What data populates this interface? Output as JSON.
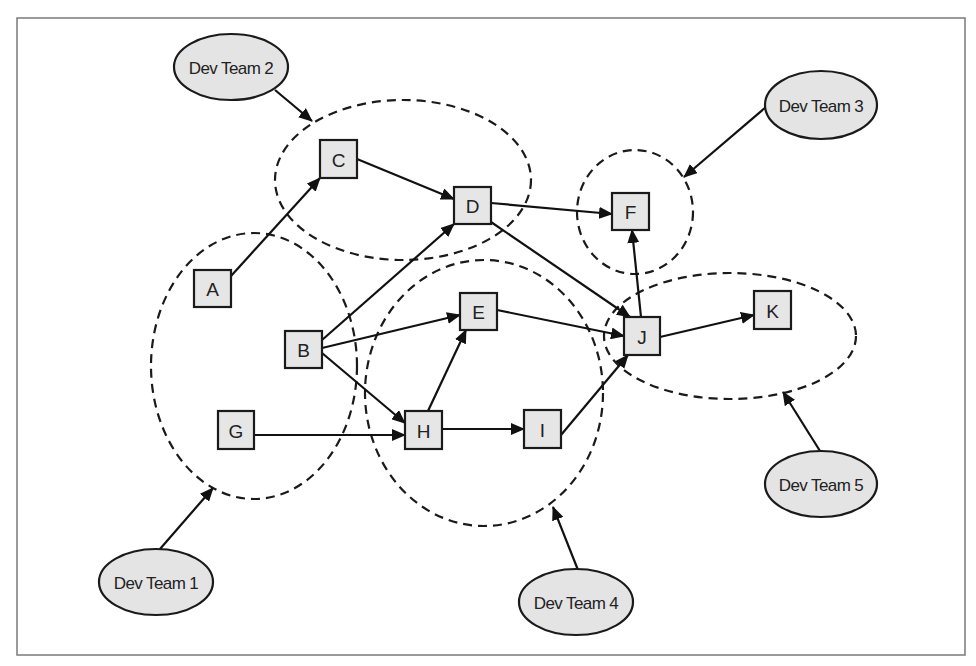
{
  "diagram": {
    "type": "dependency-graph",
    "frame": {
      "x": 17,
      "y": 18,
      "width": 948,
      "height": 637
    },
    "colors": {
      "node_fill": "#e6e6e6",
      "team_fill": "#e4e4e4",
      "stroke": "#1a1a1a",
      "frame_stroke": "#7a7a7a"
    },
    "nodes": [
      {
        "id": "A",
        "label": "A",
        "x": 194,
        "y": 270,
        "w": 37,
        "h": 37
      },
      {
        "id": "B",
        "label": "B",
        "x": 285,
        "y": 331,
        "w": 37,
        "h": 37
      },
      {
        "id": "C",
        "label": "C",
        "x": 320,
        "y": 140,
        "w": 37,
        "h": 38
      },
      {
        "id": "D",
        "label": "D",
        "x": 454,
        "y": 187,
        "w": 37,
        "h": 37
      },
      {
        "id": "E",
        "label": "E",
        "x": 460,
        "y": 293,
        "w": 37,
        "h": 37
      },
      {
        "id": "F",
        "label": "F",
        "x": 612,
        "y": 193,
        "w": 37,
        "h": 37
      },
      {
        "id": "G",
        "label": "G",
        "x": 218,
        "y": 411,
        "w": 36,
        "h": 38
      },
      {
        "id": "H",
        "label": "H",
        "x": 405,
        "y": 411,
        "w": 37,
        "h": 38
      },
      {
        "id": "I",
        "label": "I",
        "x": 524,
        "y": 410,
        "w": 37,
        "h": 38
      },
      {
        "id": "J",
        "label": "J",
        "x": 624,
        "y": 317,
        "w": 36,
        "h": 38
      },
      {
        "id": "K",
        "label": "K",
        "x": 754,
        "y": 291,
        "w": 37,
        "h": 38
      }
    ],
    "edges": [
      {
        "from": "A",
        "to": "C",
        "x1": 231,
        "y1": 276,
        "x2": 320,
        "y2": 178
      },
      {
        "from": "C",
        "to": "D",
        "x1": 357,
        "y1": 159,
        "x2": 454,
        "y2": 199
      },
      {
        "from": "B",
        "to": "D",
        "x1": 322,
        "y1": 340,
        "x2": 454,
        "y2": 224
      },
      {
        "from": "B",
        "to": "E",
        "x1": 322,
        "y1": 348,
        "x2": 460,
        "y2": 315
      },
      {
        "from": "B",
        "to": "H",
        "x1": 322,
        "y1": 353,
        "x2": 405,
        "y2": 423
      },
      {
        "from": "G",
        "to": "H",
        "x1": 254,
        "y1": 435,
        "x2": 405,
        "y2": 435
      },
      {
        "from": "H",
        "to": "E",
        "x1": 428,
        "y1": 411,
        "x2": 466,
        "y2": 330
      },
      {
        "from": "H",
        "to": "I",
        "x1": 442,
        "y1": 429,
        "x2": 524,
        "y2": 429
      },
      {
        "from": "D",
        "to": "F",
        "x1": 491,
        "y1": 203,
        "x2": 612,
        "y2": 214
      },
      {
        "from": "D",
        "to": "J",
        "x1": 491,
        "y1": 222,
        "x2": 630,
        "y2": 317
      },
      {
        "from": "E",
        "to": "J",
        "x1": 497,
        "y1": 310,
        "x2": 624,
        "y2": 336
      },
      {
        "from": "I",
        "to": "J",
        "x1": 561,
        "y1": 435,
        "x2": 628,
        "y2": 355
      },
      {
        "from": "J",
        "to": "F",
        "x1": 641,
        "y1": 317,
        "x2": 632,
        "y2": 230
      },
      {
        "from": "J",
        "to": "K",
        "x1": 660,
        "y1": 337,
        "x2": 754,
        "y2": 315
      }
    ],
    "groups": [
      {
        "id": "team1-group",
        "team": "Dev Team 1",
        "cx": 254,
        "cy": 366,
        "rx": 103,
        "ry": 133,
        "members": [
          "A",
          "B",
          "G"
        ]
      },
      {
        "id": "team2-group",
        "team": "Dev Team 2",
        "cx": 403,
        "cy": 180,
        "rx": 128,
        "ry": 80,
        "members": [
          "C",
          "D"
        ]
      },
      {
        "id": "team3-group",
        "team": "Dev Team 3",
        "cx": 635,
        "cy": 212,
        "rx": 58,
        "ry": 62,
        "members": [
          "F"
        ]
      },
      {
        "id": "team4-group",
        "team": "Dev Team 4",
        "cx": 484,
        "cy": 393,
        "rx": 119,
        "ry": 133,
        "members": [
          "E",
          "H",
          "I"
        ]
      },
      {
        "id": "team5-group",
        "team": "Dev Team 5",
        "cx": 730,
        "cy": 336,
        "rx": 126,
        "ry": 63,
        "members": [
          "J",
          "K"
        ]
      }
    ],
    "teams": [
      {
        "id": "team1",
        "label": "Dev Team 1",
        "cx": 156,
        "cy": 582,
        "rx": 57,
        "ry": 33,
        "pointer": {
          "x1": 160,
          "y1": 549,
          "x2": 213,
          "y2": 488
        }
      },
      {
        "id": "team2",
        "label": "Dev Team 2",
        "cx": 231,
        "cy": 67,
        "rx": 57,
        "ry": 33,
        "pointer": {
          "x1": 275,
          "y1": 90,
          "x2": 312,
          "y2": 121
        }
      },
      {
        "id": "team3",
        "label": "Dev Team 3",
        "cx": 821,
        "cy": 105,
        "rx": 56,
        "ry": 34,
        "pointer": {
          "x1": 766,
          "y1": 107,
          "x2": 684,
          "y2": 177
        }
      },
      {
        "id": "team4",
        "label": "Dev Team 4",
        "cx": 576,
        "cy": 602,
        "rx": 57,
        "ry": 33,
        "pointer": {
          "x1": 578,
          "y1": 570,
          "x2": 553,
          "y2": 507
        }
      },
      {
        "id": "team5",
        "label": "Dev Team 5",
        "cx": 821,
        "cy": 484,
        "rx": 56,
        "ry": 33,
        "pointer": {
          "x1": 820,
          "y1": 451,
          "x2": 783,
          "y2": 392
        }
      }
    ]
  }
}
